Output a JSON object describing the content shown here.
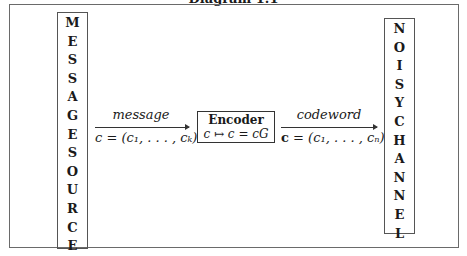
{
  "title": "Diagram 1.1",
  "source_box": {
    "letters_top": [
      "M",
      "E",
      "S",
      "S",
      "A",
      "G",
      "E"
    ],
    "letters_bottom": [
      "S",
      "O",
      "U",
      "R",
      "C",
      "E"
    ]
  },
  "arrow1": {
    "top_label": "message",
    "bottom_label": "c = (c₁, . . . , cₖ)"
  },
  "encoder": {
    "title": "Encoder",
    "formula": "c ↦ c = cG"
  },
  "arrow2": {
    "top_label": "codeword",
    "bottom_label_bold": "c",
    "bottom_label_rest": " = (c₁, . . . , cₙ)"
  },
  "channel_box": {
    "letters_top": [
      "N",
      "O",
      "I",
      "S",
      "Y"
    ],
    "letters_bottom": [
      "C",
      "H",
      "A",
      "N",
      "N",
      "E",
      "L"
    ]
  }
}
